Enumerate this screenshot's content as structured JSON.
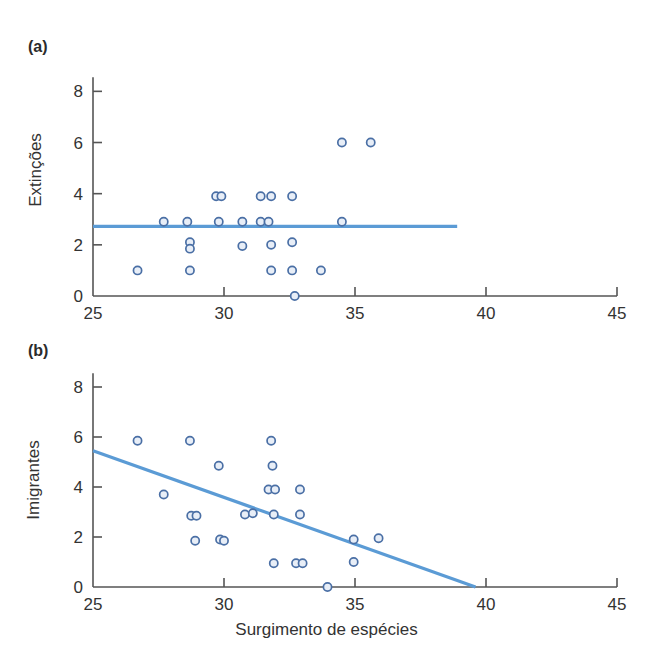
{
  "figure": {
    "background": "#ffffff",
    "marker_color": "#4a6fa5",
    "marker_fill": "#e8eef7",
    "line_color": "#5b9bd5",
    "axis_color": "#555555",
    "text_color": "#333333"
  },
  "chart_data": [
    {
      "type": "scatter",
      "panel_tag": "(a)",
      "title": "",
      "xlabel": "",
      "ylabel": "Extinções",
      "xlim": [
        25,
        45
      ],
      "ylim": [
        0,
        8.6
      ],
      "xticks": [
        25,
        30,
        35,
        40,
        45
      ],
      "yticks": [
        0,
        2,
        4,
        6,
        8
      ],
      "xticklabels": [
        "25",
        "30",
        "35",
        "40",
        "45"
      ],
      "yticklabels": [
        "0",
        "2",
        "4",
        "6",
        "8"
      ],
      "grid": false,
      "legend": "none",
      "points": [
        {
          "x": 26.7,
          "y": 1
        },
        {
          "x": 27.7,
          "y": 2.9
        },
        {
          "x": 28.6,
          "y": 2.9
        },
        {
          "x": 28.7,
          "y": 2.1
        },
        {
          "x": 28.7,
          "y": 1.85
        },
        {
          "x": 28.7,
          "y": 1
        },
        {
          "x": 29.7,
          "y": 3.9
        },
        {
          "x": 29.9,
          "y": 3.9
        },
        {
          "x": 29.8,
          "y": 2.9
        },
        {
          "x": 30.7,
          "y": 2.9
        },
        {
          "x": 30.7,
          "y": 1.95
        },
        {
          "x": 31.4,
          "y": 3.9
        },
        {
          "x": 31.8,
          "y": 3.9
        },
        {
          "x": 31.4,
          "y": 2.9
        },
        {
          "x": 31.7,
          "y": 2.9
        },
        {
          "x": 31.8,
          "y": 2.0
        },
        {
          "x": 31.8,
          "y": 1
        },
        {
          "x": 32.6,
          "y": 3.9
        },
        {
          "x": 32.6,
          "y": 2.1
        },
        {
          "x": 32.6,
          "y": 1
        },
        {
          "x": 32.7,
          "y": 0
        },
        {
          "x": 33.7,
          "y": 1
        },
        {
          "x": 34.5,
          "y": 2.9
        },
        {
          "x": 34.5,
          "y": 6
        },
        {
          "x": 35.6,
          "y": 6
        }
      ],
      "fit_line": {
        "kind": "horizontal",
        "y": 2.72,
        "x_start": 25.0,
        "x_end": 38.9
      }
    },
    {
      "type": "scatter",
      "panel_tag": "(b)",
      "title": "",
      "xlabel": "Surgimento de espécies",
      "ylabel": "Imigrantes",
      "xlim": [
        25,
        45
      ],
      "ylim": [
        0,
        8.6
      ],
      "xticks": [
        25,
        30,
        35,
        40,
        45
      ],
      "yticks": [
        0,
        2,
        4,
        6,
        8
      ],
      "xticklabels": [
        "25",
        "30",
        "35",
        "40",
        "45"
      ],
      "yticklabels": [
        "0",
        "2",
        "4",
        "6",
        "8"
      ],
      "grid": false,
      "legend": "none",
      "points": [
        {
          "x": 26.7,
          "y": 5.85
        },
        {
          "x": 27.7,
          "y": 3.7
        },
        {
          "x": 28.7,
          "y": 5.85
        },
        {
          "x": 28.75,
          "y": 2.85
        },
        {
          "x": 28.95,
          "y": 2.85
        },
        {
          "x": 28.9,
          "y": 1.85
        },
        {
          "x": 29.8,
          "y": 4.85
        },
        {
          "x": 29.85,
          "y": 1.9
        },
        {
          "x": 30.0,
          "y": 1.85
        },
        {
          "x": 30.8,
          "y": 2.9
        },
        {
          "x": 31.1,
          "y": 2.95
        },
        {
          "x": 31.8,
          "y": 5.85
        },
        {
          "x": 31.85,
          "y": 4.85
        },
        {
          "x": 31.7,
          "y": 3.9
        },
        {
          "x": 31.95,
          "y": 3.9
        },
        {
          "x": 31.9,
          "y": 2.9
        },
        {
          "x": 31.9,
          "y": 0.95
        },
        {
          "x": 32.9,
          "y": 3.9
        },
        {
          "x": 32.9,
          "y": 2.9
        },
        {
          "x": 32.75,
          "y": 0.95
        },
        {
          "x": 33.0,
          "y": 0.95
        },
        {
          "x": 33.95,
          "y": 0
        },
        {
          "x": 34.95,
          "y": 1.9
        },
        {
          "x": 34.95,
          "y": 1.0
        },
        {
          "x": 35.9,
          "y": 1.95
        }
      ],
      "fit_line": {
        "kind": "sloped",
        "x_start": 25.0,
        "y_start": 5.45,
        "x_end": 39.6,
        "y_end": 0.0
      }
    }
  ]
}
